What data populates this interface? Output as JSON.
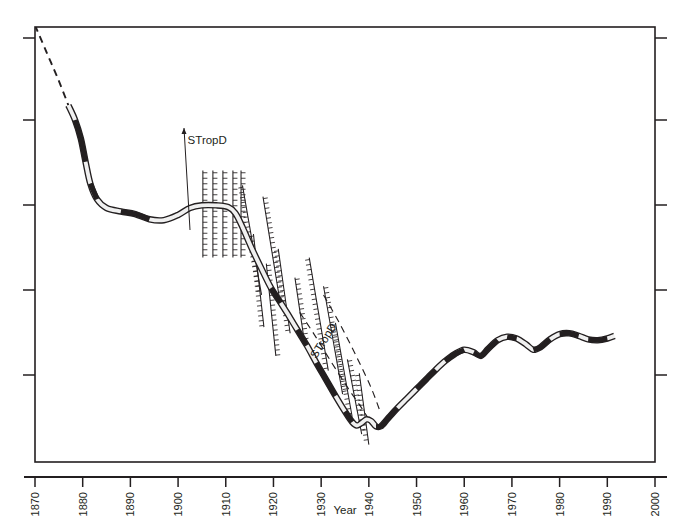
{
  "figure": {
    "background": "#ffffff",
    "ink_color": "#231f20",
    "band_fill": "#f0f0f0",
    "caption_fragment": ""
  },
  "chart_data": {
    "type": "line",
    "title": "",
    "subtitle": "",
    "xlabel": "Year",
    "ylabel": "",
    "xlim": [
      1870,
      2000
    ],
    "ylim": [
      0,
      5
    ],
    "grid": false,
    "legend": "none",
    "x_ticks": [
      1870,
      1880,
      1890,
      1900,
      1910,
      1920,
      1930,
      1940,
      1950,
      1960,
      1970,
      1980,
      1990,
      2000
    ],
    "x_tick_labels": [
      "1870",
      "1880",
      "1890",
      "1900",
      "1910",
      "1920",
      "1930",
      "1940",
      "1950",
      "1960",
      "1970",
      "1980",
      "1990",
      "2000"
    ],
    "x_tick_label_rotation": -90,
    "y_ticks": [
      0,
      1,
      2,
      3,
      4,
      5
    ],
    "y_tick_labels": [
      "",
      "",
      "",
      "",
      "",
      ""
    ],
    "y_axis_labelled": false,
    "annotations": [
      {
        "text": "STropD",
        "x": 1902,
        "y": 3.65,
        "rotation": 0,
        "leader": "vertical-arrow"
      },
      {
        "text": "STropD",
        "x": 1929,
        "y": 1.18,
        "rotation": -58,
        "leader": "none"
      }
    ],
    "series": [
      {
        "name": "boundary-position",
        "style": "double-line-band",
        "segments": [
          {
            "style": "dashed",
            "points": [
              [
                1870.0,
                5.02
              ],
              [
                1872.5,
                4.7
              ],
              [
                1875.0,
                4.38
              ],
              [
                1877.0,
                4.1
              ]
            ]
          },
          {
            "style": "solid",
            "points": [
              [
                1877.0,
                4.1
              ],
              [
                1878.4,
                3.93
              ],
              [
                1879.6,
                3.72
              ],
              [
                1880.6,
                3.45
              ],
              [
                1881.6,
                3.2
              ],
              [
                1883.0,
                3.02
              ],
              [
                1885.0,
                2.92
              ],
              [
                1888.0,
                2.88
              ],
              [
                1891.0,
                2.85
              ],
              [
                1894.0,
                2.79
              ],
              [
                1897.0,
                2.78
              ],
              [
                1900.0,
                2.84
              ],
              [
                1902.5,
                2.92
              ],
              [
                1905.0,
                2.95
              ],
              [
                1908.0,
                2.95
              ],
              [
                1910.5,
                2.93
              ],
              [
                1912.0,
                2.86
              ],
              [
                1913.5,
                2.7
              ],
              [
                1915.5,
                2.45
              ],
              [
                1917.5,
                2.22
              ],
              [
                1919.5,
                2.0
              ],
              [
                1921.5,
                1.83
              ],
              [
                1923.0,
                1.7
              ],
              [
                1925.0,
                1.52
              ],
              [
                1927.0,
                1.34
              ],
              [
                1929.0,
                1.14
              ],
              [
                1931.0,
                0.95
              ],
              [
                1933.0,
                0.76
              ],
              [
                1935.0,
                0.58
              ],
              [
                1936.5,
                0.46
              ],
              [
                1937.5,
                0.42
              ],
              [
                1938.5,
                0.45
              ],
              [
                1939.5,
                0.49
              ],
              [
                1940.5,
                0.47
              ],
              [
                1941.5,
                0.41
              ],
              [
                1942.5,
                0.41
              ],
              [
                1944.0,
                0.5
              ],
              [
                1946.0,
                0.62
              ],
              [
                1948.0,
                0.73
              ],
              [
                1950.0,
                0.84
              ],
              [
                1952.0,
                0.95
              ],
              [
                1954.0,
                1.06
              ],
              [
                1956.0,
                1.16
              ],
              [
                1958.0,
                1.24
              ],
              [
                1960.0,
                1.29
              ],
              [
                1962.0,
                1.26
              ],
              [
                1963.5,
                1.22
              ],
              [
                1965.0,
                1.3
              ],
              [
                1967.0,
                1.4
              ],
              [
                1969.0,
                1.44
              ],
              [
                1971.0,
                1.42
              ],
              [
                1973.0,
                1.35
              ],
              [
                1974.5,
                1.29
              ],
              [
                1976.0,
                1.32
              ],
              [
                1978.0,
                1.41
              ],
              [
                1980.0,
                1.47
              ],
              [
                1982.0,
                1.48
              ],
              [
                1984.0,
                1.45
              ],
              [
                1986.0,
                1.41
              ],
              [
                1988.0,
                1.4
              ],
              [
                1990.0,
                1.42
              ],
              [
                1991.5,
                1.45
              ]
            ]
          }
        ]
      },
      {
        "name": "dashed-trend-lower",
        "style": "dashed",
        "points": [
          [
            1925.5,
            1.72
          ],
          [
            1928.5,
            1.47
          ],
          [
            1932.0,
            1.16
          ],
          [
            1935.5,
            0.86
          ],
          [
            1938.5,
            0.62
          ],
          [
            1940.0,
            0.49
          ]
        ]
      },
      {
        "name": "dashed-trend-right",
        "style": "dashed",
        "points": [
          [
            1930.5,
            1.92
          ],
          [
            1934.0,
            1.58
          ],
          [
            1937.5,
            1.2
          ],
          [
            1940.5,
            0.85
          ],
          [
            1942.5,
            0.56
          ]
        ]
      }
    ],
    "hatched_features": {
      "description": "tick-marked (barbed) structural lines",
      "vertical_group": {
        "x_values": [
          1905.2,
          1907.3,
          1909.4,
          1911.5,
          1913.2
        ],
        "y_top": 3.35,
        "y_bottom": 2.35
      },
      "diagonal_lines": [
        {
          "x1": 1913.5,
          "y1": 3.18,
          "x2": 1917.5,
          "y2": 1.92
        },
        {
          "x1": 1917.8,
          "y1": 3.05,
          "x2": 1921.5,
          "y2": 1.8
        },
        {
          "x1": 1921.0,
          "y1": 2.45,
          "x2": 1923.5,
          "y2": 1.48
        },
        {
          "x1": 1924.5,
          "y1": 2.12,
          "x2": 1926.5,
          "y2": 1.38
        },
        {
          "x1": 1927.5,
          "y1": 2.35,
          "x2": 1931.5,
          "y2": 1.05
        },
        {
          "x1": 1930.5,
          "y1": 2.02,
          "x2": 1934.5,
          "y2": 0.78
        },
        {
          "x1": 1933.0,
          "y1": 1.6,
          "x2": 1936.5,
          "y2": 0.52
        },
        {
          "x1": 1935.5,
          "y1": 1.18,
          "x2": 1938.5,
          "y2": 0.32
        },
        {
          "x1": 1938.0,
          "y1": 1.02,
          "x2": 1940.0,
          "y2": 0.2
        },
        {
          "x1": 1918.5,
          "y1": 2.28,
          "x2": 1920.5,
          "y2": 1.22
        },
        {
          "x1": 1915.8,
          "y1": 2.62,
          "x2": 1918.0,
          "y2": 1.55
        }
      ]
    }
  },
  "axes": {
    "x_axis_name": "Year",
    "frame": {
      "left": 35,
      "right": 655,
      "top": 27,
      "bottom": 462
    }
  }
}
